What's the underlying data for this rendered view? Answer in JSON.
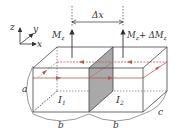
{
  "diagram": {
    "axes": {
      "z": "z",
      "y": "y",
      "x": "x"
    },
    "moment_left": {
      "base": "M",
      "sub": "z"
    },
    "moment_right": {
      "base": "M",
      "sub": "z",
      "plus": "+ ΔM",
      "sub2": "z"
    },
    "delta_x": "Δx",
    "current_left": {
      "base": "I",
      "sub": "1"
    },
    "current_right": {
      "base": "I",
      "sub": "2"
    },
    "dim_a": "a",
    "dim_b_left": "b",
    "dim_b_right": "b",
    "dim_c": "c",
    "colors": {
      "line": "#555555",
      "current": "#b25a5a",
      "shade": "#a9a9a9",
      "text": "#333333"
    }
  }
}
